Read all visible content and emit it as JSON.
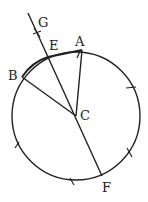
{
  "diagram": {
    "labels": {
      "G": "G",
      "E": "E",
      "A": "A",
      "B": "B",
      "C": "C",
      "F": "F"
    },
    "stroke_color": "#222222",
    "background": "#ffffff"
  }
}
